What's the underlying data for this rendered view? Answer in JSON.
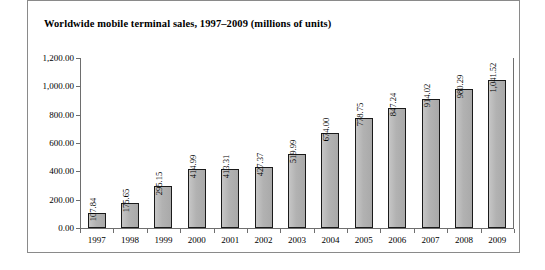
{
  "chart_data": {
    "type": "bar",
    "title": "Worldwide mobile terminal sales, 1997–2009 (millions of units)",
    "xlabel": "",
    "ylabel": "",
    "grid": false,
    "legend": "none",
    "ylim": [
      0,
      1200
    ],
    "ytick_labels": [
      "1,200.00",
      "1,000.00",
      "800.00",
      "600.00",
      "400.00",
      "200.00",
      "0.00"
    ],
    "ytick_values": [
      1200,
      1000,
      800,
      600,
      400,
      200,
      0
    ],
    "categories": [
      "1997",
      "1998",
      "1999",
      "2000",
      "2001",
      "2002",
      "2003",
      "2004",
      "2005",
      "2006",
      "2007",
      "2008",
      "2009"
    ],
    "values": [
      107.84,
      175.65,
      295.15,
      414.99,
      413.31,
      427.37,
      519.99,
      674.0,
      778.75,
      847.24,
      914.02,
      980.29,
      1041.52
    ],
    "value_labels": [
      "107.84",
      "175.65",
      "295.15",
      "414.99",
      "413.31",
      "427.37",
      "519.99",
      "674.00",
      "778.75",
      "847.24",
      "914.02",
      "980.29",
      "1,041.52"
    ],
    "bar_color": "#b5b5b5",
    "bar_edge_color": "#1a1a1a",
    "axis_color": "#6e6e6e",
    "background_color": "#ffffff",
    "frame_color": "#8a8a8a"
  }
}
